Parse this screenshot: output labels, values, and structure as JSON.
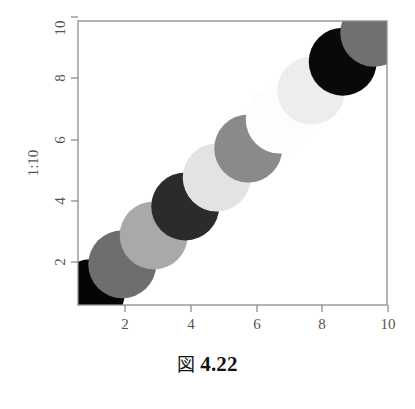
{
  "figure": {
    "caption_mark": "図",
    "caption_number": "4.22"
  },
  "chart_data": {
    "type": "scatter",
    "title": "",
    "xlabel": "Index",
    "ylabel": "1:10",
    "x": [
      1,
      2,
      3,
      4,
      5,
      6,
      7,
      8,
      9,
      10
    ],
    "y": [
      1,
      2,
      3,
      4,
      5,
      6,
      7,
      8,
      9,
      10
    ],
    "xlim": [
      0.595,
      10.405
    ],
    "ylim": [
      0.595,
      10.405
    ],
    "xticks": [
      2,
      4,
      6,
      8,
      10
    ],
    "xtick_labels": [
      "2",
      "4",
      "6",
      "8",
      "10"
    ],
    "yticks": [
      2,
      4,
      6,
      8,
      10
    ],
    "ytick_labels": [
      "2",
      "4",
      "6",
      "8",
      "10"
    ],
    "grid": false,
    "legend": null,
    "marker": "filled-circle",
    "marker_radius_px": 34,
    "point_colors": [
      "#050505",
      "#6e6e6e",
      "#a9a9a9",
      "#2b2b2b",
      "#e3e3e3",
      "#8a8a8a",
      "#fdfdfd",
      "#ededed",
      "#090909",
      "#707070"
    ],
    "points": [
      {
        "index": 1,
        "x": 1,
        "y": 1,
        "color": "#050505"
      },
      {
        "index": 2,
        "x": 2,
        "y": 2,
        "color": "#6e6e6e"
      },
      {
        "index": 3,
        "x": 3,
        "y": 3,
        "color": "#a9a9a9"
      },
      {
        "index": 4,
        "x": 4,
        "y": 4,
        "color": "#2b2b2b"
      },
      {
        "index": 5,
        "x": 5,
        "y": 5,
        "color": "#e3e3e3"
      },
      {
        "index": 6,
        "x": 6,
        "y": 6,
        "color": "#8a8a8a"
      },
      {
        "index": 7,
        "x": 7,
        "y": 7,
        "color": "#fdfdfd"
      },
      {
        "index": 8,
        "x": 8,
        "y": 8,
        "color": "#ededed"
      },
      {
        "index": 9,
        "x": 9,
        "y": 9,
        "color": "#090909"
      },
      {
        "index": 10,
        "x": 10,
        "y": 10,
        "color": "#707070"
      }
    ],
    "axis_color": "#8c8c8c",
    "box_color": "#8c8c8c",
    "background_color": "#ffffff"
  }
}
